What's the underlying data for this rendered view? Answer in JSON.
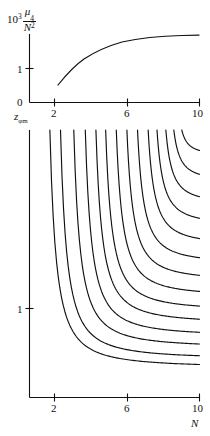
{
  "figure": {
    "background": "#ffffff",
    "ink_color": "#111111",
    "width": 210,
    "height": 436
  },
  "top_panel": {
    "ylabel_prefix": "10",
    "ylabel_exponent": "3",
    "ylabel_numerator_symbol": "μ",
    "ylabel_numerator_subscript": "4",
    "ylabel_denominator_symbol": "N",
    "ylabel_denominator_exponent": "2",
    "ytick_labels": [
      "0",
      "1"
    ],
    "xtick_labels": [
      "2",
      "6",
      "10"
    ]
  },
  "bottom_panel": {
    "ylabel": "z",
    "ylabel_subscript": "φm",
    "ytick_labels": [
      "1"
    ],
    "xtick_labels": [
      "2",
      "6",
      "10"
    ],
    "xlabel": "N"
  },
  "chart_data": [
    {
      "type": "line",
      "title": "",
      "xlabel": "N",
      "ylabel": "10^3 μ_4 / N^2",
      "xlim": [
        1.0,
        10.6
      ],
      "ylim": [
        0,
        1.75
      ],
      "xticks": [
        2,
        6,
        10
      ],
      "xtick_labels": [
        "2",
        "6",
        "10"
      ],
      "yticks": [
        0,
        1
      ],
      "ytick_labels": [
        "0",
        "1"
      ],
      "grid": false,
      "legend": "none",
      "series": [
        {
          "name": "10^3 mu_4 / N^2",
          "x": [
            2.2,
            2.4,
            2.7,
            3.0,
            3.4,
            3.8,
            4.2,
            4.6,
            5.0,
            5.5,
            6.0,
            6.5,
            7.0,
            7.5,
            8.0,
            8.5,
            9.0,
            9.5,
            10.0,
            10.4
          ],
          "y": [
            0.28,
            0.46,
            0.64,
            0.78,
            0.92,
            1.03,
            1.11,
            1.18,
            1.23,
            1.28,
            1.32,
            1.35,
            1.37,
            1.39,
            1.4,
            1.41,
            1.415,
            1.42,
            1.42,
            1.42
          ]
        }
      ]
    },
    {
      "type": "line",
      "title": "",
      "xlabel": "N",
      "ylabel": "z_φm",
      "xlim": [
        1.0,
        10.6
      ],
      "ylim": [
        0.72,
        2.6
      ],
      "xticks": [
        2,
        6,
        10
      ],
      "xtick_labels": [
        "2",
        "6",
        "10"
      ],
      "yticks": [
        1
      ],
      "ytick_labels": [
        "1"
      ],
      "grid": false,
      "legend": "none",
      "note": "family of 14 monotonically decreasing curves, each entering from the top edge and flattening toward the right",
      "series": [
        {
          "name": "curve-1",
          "x_start": 2.15,
          "y_at_10": 0.93
        },
        {
          "name": "curve-2",
          "x_start": 2.75,
          "y_at_10": 0.99
        },
        {
          "name": "curve-3",
          "x_start": 3.5,
          "y_at_10": 1.07
        },
        {
          "name": "curve-4",
          "x_start": 4.15,
          "y_at_10": 1.15
        },
        {
          "name": "curve-5",
          "x_start": 4.75,
          "y_at_10": 1.24
        },
        {
          "name": "curve-6",
          "x_start": 5.3,
          "y_at_10": 1.33
        },
        {
          "name": "curve-7",
          "x_start": 5.9,
          "y_at_10": 1.43
        },
        {
          "name": "curve-8",
          "x_start": 6.5,
          "y_at_10": 1.54
        },
        {
          "name": "curve-9",
          "x_start": 7.1,
          "y_at_10": 1.66
        },
        {
          "name": "curve-10",
          "x_start": 7.7,
          "y_at_10": 1.79
        },
        {
          "name": "curve-11",
          "x_start": 8.2,
          "y_at_10": 1.93
        },
        {
          "name": "curve-12",
          "x_start": 8.7,
          "y_at_10": 2.08
        },
        {
          "name": "curve-13",
          "x_start": 9.15,
          "y_at_10": 2.24
        },
        {
          "name": "curve-14",
          "x_start": 9.6,
          "y_at_10": 2.42
        }
      ]
    }
  ]
}
